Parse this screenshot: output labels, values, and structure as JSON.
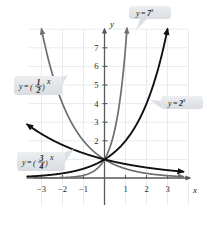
{
  "chart_data": {
    "type": "line",
    "title": "",
    "xlabel": "x",
    "ylabel": "y",
    "xlim": [
      -3.8,
      3.8
    ],
    "ylim": [
      -0.75,
      8.2
    ],
    "grid": true,
    "grid_color": "#dfe7ee",
    "xticks": [
      "-3",
      "-2",
      "-1",
      "1",
      "2",
      "3"
    ],
    "xtick_values": [
      -3,
      -2,
      -1,
      1,
      2,
      3
    ],
    "yticks": [
      "2",
      "3",
      "4",
      "5",
      "6",
      "7"
    ],
    "ytick_values": [
      2,
      3,
      4,
      5,
      6,
      7
    ],
    "legend_position": "callout-annotations",
    "series": [
      {
        "name": "y = 7^x",
        "base": 7,
        "color": "#6e6e6e",
        "label_html": "y = 7<tspan baseline-shift=\"super\" font-size=\"6\">x</tspan>",
        "points": [
          {
            "x": -3.7,
            "y": 0.002
          },
          {
            "x": -2.0,
            "y": 0.0204
          },
          {
            "x": -1.0,
            "y": 0.1429
          },
          {
            "x": -0.5,
            "y": 0.378
          },
          {
            "x": 0.0,
            "y": 1.0
          },
          {
            "x": 0.5,
            "y": 2.646
          },
          {
            "x": 0.8,
            "y": 4.743
          },
          {
            "x": 1.0,
            "y": 7.0
          },
          {
            "x": 1.08,
            "y": 8.2
          }
        ]
      },
      {
        "name": "y = 2^x",
        "base": 2,
        "color": "#111111",
        "label_html": "y = 2<tspan baseline-shift=\"super\" font-size=\"6\">x</tspan>",
        "points": [
          {
            "x": -3.7,
            "y": 0.077
          },
          {
            "x": -3.0,
            "y": 0.125
          },
          {
            "x": -2.0,
            "y": 0.25
          },
          {
            "x": -1.0,
            "y": 0.5
          },
          {
            "x": 0.0,
            "y": 1.0
          },
          {
            "x": 1.0,
            "y": 2.0
          },
          {
            "x": 2.0,
            "y": 4.0
          },
          {
            "x": 2.8,
            "y": 6.96
          },
          {
            "x": 3.03,
            "y": 8.2
          }
        ]
      },
      {
        "name": "y = (1/2)^x",
        "base": 0.5,
        "color": "#6e6e6e",
        "label_html": "y = (1/2)<tspan baseline-shift=\"super\" font-size=\"6\">x</tspan>",
        "points": [
          {
            "x": -3.03,
            "y": 8.2
          },
          {
            "x": -2.8,
            "y": 6.96
          },
          {
            "x": -2.0,
            "y": 4.0
          },
          {
            "x": -1.0,
            "y": 2.0
          },
          {
            "x": 0.0,
            "y": 1.0
          },
          {
            "x": 1.0,
            "y": 0.5
          },
          {
            "x": 2.0,
            "y": 0.25
          },
          {
            "x": 3.0,
            "y": 0.125
          },
          {
            "x": 3.7,
            "y": 0.077
          }
        ]
      },
      {
        "name": "y = (3/4)^x",
        "base": 0.75,
        "color": "#111111",
        "label_html": "y = (3/4)<tspan baseline-shift=\"super\" font-size=\"6\">x</tspan>",
        "points": [
          {
            "x": -3.55,
            "y": 3.24
          },
          {
            "x": -3.0,
            "y": 2.37
          },
          {
            "x": -2.0,
            "y": 1.778
          },
          {
            "x": -1.0,
            "y": 1.333
          },
          {
            "x": 0.0,
            "y": 1.0
          },
          {
            "x": 1.0,
            "y": 0.75
          },
          {
            "x": 2.0,
            "y": 0.5625
          },
          {
            "x": 3.0,
            "y": 0.4219
          },
          {
            "x": 3.7,
            "y": 0.333
          }
        ]
      }
    ],
    "annotations": [
      {
        "id": "label-7x",
        "text": "y = 7",
        "exponent": "x",
        "kind": "simple",
        "base_text": "7",
        "box": {
          "x": 129,
          "y": 6,
          "w": 42,
          "h": 13
        },
        "tail": [
          [
            140,
            19
          ],
          [
            147,
            19
          ],
          [
            136,
            30
          ]
        ]
      },
      {
        "id": "label-2x",
        "text": "y = 2",
        "exponent": "x",
        "kind": "simple",
        "base_text": "2",
        "box": {
          "x": 161,
          "y": 96,
          "w": 42,
          "h": 13
        },
        "tail": [
          [
            161,
            101
          ],
          [
            161,
            108
          ],
          [
            150,
            100
          ]
        ]
      },
      {
        "id": "label-half-x",
        "text": "y = ",
        "exponent": "x",
        "kind": "fraction",
        "numerator": "1",
        "denominator": "2",
        "box": {
          "x": 14,
          "y": 76,
          "w": 48,
          "h": 19
        },
        "tail": [
          [
            58,
            78
          ],
          [
            68,
            75
          ],
          [
            60,
            88
          ]
        ]
      },
      {
        "id": "label-threequarter-x",
        "text": "y = ",
        "exponent": "x",
        "kind": "fraction",
        "numerator": "3",
        "denominator": "4",
        "box": {
          "x": 17,
          "y": 152,
          "w": 48,
          "h": 19
        },
        "tail": [
          [
            63,
            153
          ],
          [
            74,
            149
          ],
          [
            65,
            162
          ]
        ]
      }
    ]
  },
  "axes": {
    "x_label": "x",
    "y_label": "y"
  }
}
